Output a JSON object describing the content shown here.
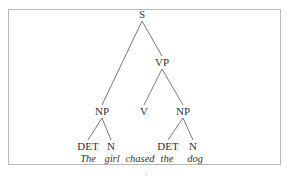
{
  "diagram": {
    "type": "syntax-tree",
    "nodes": [
      {
        "id": "S",
        "label": "S"
      },
      {
        "id": "VP",
        "label": "VP"
      },
      {
        "id": "NP1",
        "label": "NP"
      },
      {
        "id": "V",
        "label": "V"
      },
      {
        "id": "NP2",
        "label": "NP"
      },
      {
        "id": "DET1",
        "label": "DET"
      },
      {
        "id": "N1",
        "label": "N"
      },
      {
        "id": "DET2",
        "label": "DET"
      },
      {
        "id": "N2",
        "label": "N"
      }
    ],
    "edges": [
      [
        "S",
        "NP1"
      ],
      [
        "S",
        "VP"
      ],
      [
        "VP",
        "V"
      ],
      [
        "VP",
        "NP2"
      ],
      [
        "NP1",
        "DET1"
      ],
      [
        "NP1",
        "N1"
      ],
      [
        "NP2",
        "DET2"
      ],
      [
        "NP2",
        "N2"
      ]
    ],
    "words": [
      "The",
      "girl",
      "chased",
      "the",
      "dog"
    ]
  }
}
